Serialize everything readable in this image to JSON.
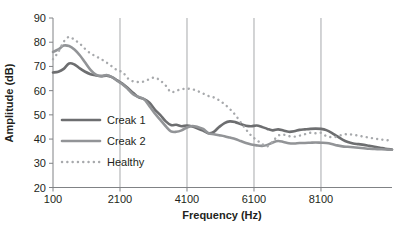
{
  "chart_data": {
    "type": "line",
    "title": "",
    "xlabel": "Frequency (Hz)",
    "ylabel": "Amplitude (dB)",
    "xlim": [
      100,
      10220
    ],
    "ylim": [
      20,
      90
    ],
    "xticks": [
      100,
      2100,
      4100,
      6100,
      8100
    ],
    "xtick_labels": [
      "100",
      "2100",
      "4100",
      "6100",
      "8100"
    ],
    "yticks": [
      20,
      30,
      40,
      50,
      60,
      70,
      80,
      90
    ],
    "ytick_labels": [
      "20",
      "30",
      "40",
      "50",
      "60",
      "70",
      "80",
      "90"
    ],
    "grid": "vertical-only",
    "legend_position": "inside-left-middle",
    "series": [
      {
        "name": "Creak 1",
        "color": "#6d6e70",
        "style": "solid",
        "width": 2.6,
        "x": [
          100,
          260,
          420,
          580,
          740,
          900,
          1060,
          1220,
          1380,
          1540,
          1700,
          1860,
          2020,
          2180,
          2340,
          2500,
          2660,
          2820,
          2980,
          3140,
          3300,
          3460,
          3620,
          3780,
          3940,
          4100,
          4260,
          4420,
          4580,
          4740,
          4900,
          5060,
          5220,
          5380,
          5540,
          5700,
          5860,
          6020,
          6180,
          6340,
          6500,
          6660,
          6820,
          6980,
          7140,
          7300,
          7460,
          7620,
          7780,
          7940,
          8100,
          8260,
          8420,
          8580,
          8740,
          8900,
          9060,
          9220,
          9380,
          9540,
          9700,
          9860,
          10020,
          10220
        ],
        "y": [
          67.5,
          67.8,
          69.0,
          71.2,
          70.8,
          69.2,
          67.8,
          66.8,
          66.3,
          66.0,
          66.2,
          65.6,
          64.2,
          62.8,
          61.0,
          59.0,
          57.2,
          56.5,
          55.0,
          52.2,
          50.0,
          47.4,
          45.8,
          45.9,
          45.3,
          45.6,
          45.2,
          44.4,
          43.5,
          42.4,
          43.0,
          45.0,
          46.6,
          47.3,
          47.0,
          46.2,
          45.5,
          45.3,
          45.6,
          45.0,
          44.2,
          43.6,
          44.0,
          43.5,
          43.0,
          43.2,
          43.8,
          44.0,
          44.2,
          44.3,
          44.2,
          43.7,
          42.6,
          41.2,
          39.8,
          38.8,
          38.2,
          37.9,
          37.6,
          37.2,
          36.8,
          36.4,
          36.0,
          35.7
        ]
      },
      {
        "name": "Creak 2",
        "color": "#929497",
        "style": "solid",
        "width": 2.6,
        "x": [
          100,
          260,
          420,
          580,
          740,
          900,
          1060,
          1220,
          1380,
          1540,
          1700,
          1860,
          2020,
          2180,
          2340,
          2500,
          2660,
          2820,
          2980,
          3140,
          3300,
          3460,
          3620,
          3780,
          3940,
          4100,
          4260,
          4420,
          4580,
          4740,
          4900,
          5060,
          5220,
          5380,
          5540,
          5700,
          5860,
          6020,
          6180,
          6340,
          6500,
          6660,
          6820,
          6980,
          7140,
          7300,
          7460,
          7620,
          7780,
          7940,
          8100,
          8260,
          8420,
          8580,
          8740,
          8900,
          9060,
          9220,
          9380,
          9540,
          9700,
          9860,
          10020,
          10220
        ],
        "y": [
          76.0,
          77.0,
          78.6,
          78.4,
          77.0,
          74.6,
          71.6,
          68.6,
          66.6,
          66.0,
          66.4,
          65.6,
          64.0,
          62.6,
          60.6,
          58.4,
          57.4,
          56.4,
          53.6,
          50.6,
          48.0,
          45.4,
          43.2,
          43.0,
          43.6,
          44.8,
          45.4,
          45.0,
          44.2,
          42.4,
          42.0,
          41.6,
          41.2,
          40.6,
          40.0,
          39.2,
          38.4,
          37.8,
          37.4,
          37.2,
          37.6,
          38.6,
          39.2,
          38.8,
          38.3,
          38.2,
          38.4,
          38.4,
          38.5,
          38.6,
          38.5,
          38.4,
          38.0,
          37.4,
          37.0,
          36.8,
          36.6,
          36.4,
          36.2,
          36.0,
          35.9,
          35.8,
          35.7,
          35.6
        ]
      },
      {
        "name": "Healthy",
        "color": "#a7a9ac",
        "style": "dotted",
        "width": 2.4,
        "x": [
          100,
          260,
          420,
          580,
          740,
          900,
          1060,
          1220,
          1380,
          1540,
          1700,
          1860,
          2020,
          2180,
          2340,
          2500,
          2660,
          2820,
          2980,
          3140,
          3300,
          3460,
          3620,
          3780,
          3940,
          4100,
          4260,
          4420,
          4580,
          4740,
          4900,
          5060,
          5220,
          5380,
          5540,
          5700,
          5860,
          6020,
          6180,
          6340,
          6500,
          6660,
          6820,
          6980,
          7140,
          7300,
          7460,
          7620,
          7780,
          7940,
          8100,
          8260,
          8420,
          8580,
          8740,
          8900,
          9060,
          9220,
          9380,
          9540,
          9700,
          9860,
          10020,
          10220
        ],
        "y": [
          73.0,
          76.0,
          80.2,
          82.2,
          81.0,
          79.4,
          77.2,
          75.4,
          74.2,
          73.0,
          71.6,
          70.0,
          68.4,
          67.6,
          65.0,
          63.8,
          63.6,
          63.8,
          64.8,
          65.4,
          64.2,
          62.2,
          59.4,
          60.0,
          60.6,
          60.8,
          60.6,
          59.8,
          58.8,
          57.8,
          57.2,
          56.0,
          54.4,
          52.4,
          50.0,
          47.0,
          44.0,
          41.4,
          39.6,
          38.0,
          37.0,
          39.0,
          41.4,
          41.8,
          41.2,
          41.0,
          41.4,
          42.0,
          42.6,
          42.4,
          42.6,
          41.2,
          40.8,
          41.0,
          41.8,
          42.0,
          41.8,
          41.4,
          41.0,
          40.6,
          40.2,
          39.9,
          39.6,
          39.4
        ]
      }
    ]
  },
  "legend": {
    "items": [
      {
        "label": "Creak 1",
        "swatch": "solid-dark-gray-line"
      },
      {
        "label": "Creak 2",
        "swatch": "solid-mid-gray-line"
      },
      {
        "label": "Healthy",
        "swatch": "dotted-light-gray-line"
      }
    ]
  },
  "colors": {
    "creak1": "#6d6e70",
    "creak2": "#929497",
    "healthy": "#a7a9ac",
    "axis": "#808285",
    "gridline": "#a7a9ac",
    "text": "#231f20",
    "background": "#ffffff"
  }
}
